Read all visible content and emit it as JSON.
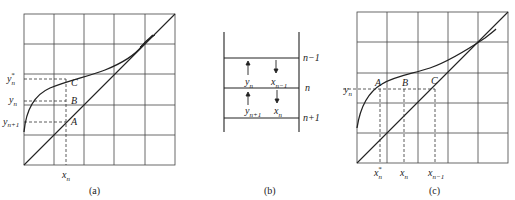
{
  "panels": {
    "a": {
      "caption": "(a)",
      "points": {
        "A": "A",
        "B": "B",
        "C": "C"
      },
      "y_labels": {
        "y_star_n": "y*n",
        "y_n": "yn",
        "y_n1": "yn+1"
      },
      "x_labels": {
        "x_n": "xn"
      }
    },
    "b": {
      "caption": "(b)",
      "stage_labels": [
        "n−1",
        "n",
        "n+1"
      ],
      "flow_labels": {
        "y_n": "yn",
        "x_n_minus_1": "xn−1",
        "y_n_plus_1": "yn+1",
        "x_n": "xn"
      }
    },
    "c": {
      "caption": "(c)",
      "points": {
        "A": "A",
        "B": "B",
        "C": "C"
      },
      "y_labels": {
        "y_n": "yn"
      },
      "x_labels": {
        "x_star_n": "x*n",
        "x_n": "xn",
        "x_n_minus_1": "xn−1"
      }
    }
  }
}
